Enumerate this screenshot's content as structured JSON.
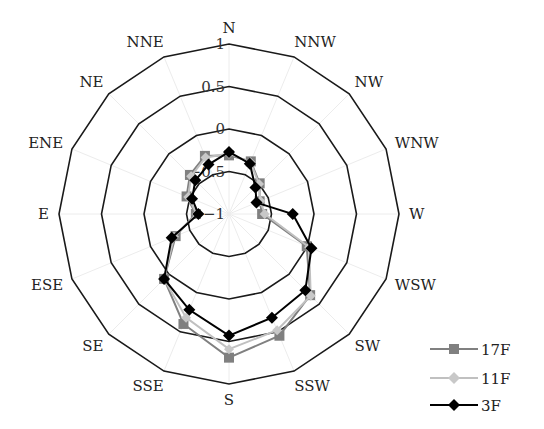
{
  "chart_data": {
    "type": "radar",
    "title": "",
    "categories": [
      "N",
      "NNW",
      "NW",
      "WNW",
      "W",
      "WSW",
      "SW",
      "SSW",
      "S",
      "SSE",
      "SE",
      "ESE",
      "E",
      "ENE",
      "NE",
      "NNE"
    ],
    "rlim": [
      -1,
      1
    ],
    "ring_ticks": [
      -1,
      -0.5,
      0,
      0.5,
      1
    ],
    "ring_tick_labels": [
      "-1",
      "-0.5",
      "0",
      "0.5",
      "1"
    ],
    "grid": true,
    "legend_position": "lower right",
    "series": [
      {
        "name": "17F",
        "marker": "square",
        "color": "#808080",
        "values": [
          -0.31,
          -0.33,
          -0.49,
          -0.61,
          -0.61,
          -0.01,
          0.35,
          0.55,
          0.69,
          0.4,
          0.08,
          -0.32,
          -0.61,
          -0.46,
          -0.35,
          -0.26
        ]
      },
      {
        "name": "11F",
        "marker": "diamond",
        "color": "#c0c0c0",
        "values": [
          -0.29,
          -0.34,
          -0.5,
          -0.6,
          -0.58,
          0.02,
          0.36,
          0.48,
          0.59,
          0.32,
          0.08,
          -0.3,
          -0.62,
          -0.48,
          -0.37,
          -0.28
        ]
      },
      {
        "name": "3F",
        "marker": "diamond",
        "color": "#000000",
        "values": [
          -0.27,
          -0.36,
          -0.56,
          -0.65,
          -0.25,
          0.05,
          0.27,
          0.32,
          0.43,
          0.22,
          0.08,
          -0.27,
          -0.64,
          -0.53,
          -0.44,
          -0.37
        ]
      }
    ]
  },
  "legend": {
    "items": [
      {
        "label": "17F"
      },
      {
        "label": "11F"
      },
      {
        "label": "3F"
      }
    ]
  }
}
